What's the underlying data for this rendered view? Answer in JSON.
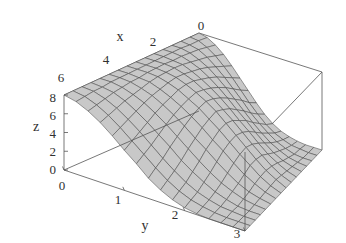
{
  "figure": {
    "type": "surface-plot-3d",
    "background_color": "#ffffff",
    "frame_color": "#555555",
    "surface_fill": "#c8c8c8",
    "mesh_color": "#4a4a4a"
  },
  "chart_data": {
    "type": "line",
    "plot_kind": "surface3d",
    "title": "",
    "xlabel": "x",
    "ylabel": "y",
    "zlabel": "z",
    "xlim": [
      0,
      6
    ],
    "ylim": [
      0,
      3
    ],
    "zlim": [
      0,
      8
    ],
    "x_ticks": [
      "0",
      "2",
      "4",
      "6"
    ],
    "x_tick_values": [
      0,
      2,
      4,
      6
    ],
    "y_ticks": [
      "0",
      "1",
      "2",
      "3"
    ],
    "y_tick_values": [
      0,
      1,
      2,
      3
    ],
    "z_ticks": [
      "0",
      "2",
      "4",
      "6",
      "8"
    ],
    "z_tick_values": [
      0,
      2,
      4,
      6,
      8
    ],
    "grid": false,
    "legend": "none",
    "mesh_rows": 15,
    "mesh_cols": 15,
    "surface_description": "Arched ridge surface, maximum ridge along x running near y=0 side and falling to zero at y=3 front corner",
    "surface_z_grid": [
      [
        8.0,
        8.0,
        8.0,
        8.0,
        8.0,
        8.0,
        8.0,
        8.0,
        8.0,
        8.0,
        8.0,
        8.0,
        8.0,
        8.0,
        8.0,
        8.0
      ],
      [
        7.8,
        7.9,
        7.9,
        8.0,
        8.0,
        8.0,
        8.0,
        8.0,
        8.0,
        8.0,
        8.0,
        8.0,
        7.9,
        7.9,
        7.8,
        7.7
      ],
      [
        7.3,
        7.5,
        7.7,
        7.8,
        7.9,
        7.9,
        8.0,
        8.0,
        8.0,
        7.9,
        7.9,
        7.8,
        7.7,
        7.5,
        7.3,
        7.1
      ],
      [
        6.6,
        6.9,
        7.2,
        7.4,
        7.6,
        7.8,
        7.9,
        7.9,
        7.9,
        7.8,
        7.6,
        7.4,
        7.2,
        6.9,
        6.6,
        6.3
      ],
      [
        5.7,
        6.1,
        6.5,
        6.9,
        7.2,
        7.4,
        7.6,
        7.7,
        7.6,
        7.4,
        7.2,
        6.9,
        6.5,
        6.1,
        5.7,
        5.3
      ],
      [
        4.7,
        5.2,
        5.7,
        6.2,
        6.6,
        6.9,
        7.2,
        7.3,
        7.2,
        6.9,
        6.6,
        6.2,
        5.7,
        5.2,
        4.7,
        4.2
      ],
      [
        3.7,
        4.2,
        4.8,
        5.4,
        5.9,
        6.3,
        6.6,
        6.8,
        6.6,
        6.3,
        5.9,
        5.4,
        4.8,
        4.2,
        3.7,
        3.2
      ],
      [
        2.7,
        3.2,
        3.9,
        4.5,
        5.1,
        5.6,
        6.0,
        6.2,
        6.0,
        5.6,
        5.1,
        4.5,
        3.9,
        3.2,
        2.7,
        2.1
      ],
      [
        1.8,
        2.3,
        2.9,
        3.6,
        4.2,
        4.8,
        5.2,
        5.5,
        5.2,
        4.8,
        4.2,
        3.6,
        2.9,
        2.3,
        1.8,
        1.3
      ],
      [
        1.1,
        1.5,
        2.1,
        2.7,
        3.4,
        3.9,
        4.4,
        4.6,
        4.4,
        3.9,
        3.4,
        2.7,
        2.1,
        1.5,
        1.1,
        0.7
      ],
      [
        0.6,
        0.9,
        1.4,
        1.9,
        2.5,
        3.1,
        3.5,
        3.7,
        3.5,
        3.1,
        2.5,
        1.9,
        1.4,
        0.9,
        0.6,
        0.3
      ],
      [
        0.3,
        0.5,
        0.8,
        1.2,
        1.7,
        2.2,
        2.6,
        2.8,
        2.6,
        2.2,
        1.7,
        1.2,
        0.8,
        0.5,
        0.3,
        0.1
      ],
      [
        0.1,
        0.2,
        0.4,
        0.7,
        1.0,
        1.4,
        1.8,
        1.9,
        1.8,
        1.4,
        1.0,
        0.7,
        0.4,
        0.2,
        0.1,
        0.0
      ],
      [
        0.0,
        0.1,
        0.1,
        0.3,
        0.5,
        0.8,
        1.0,
        1.1,
        1.0,
        0.8,
        0.5,
        0.3,
        0.1,
        0.1,
        0.0,
        0.0
      ],
      [
        0.0,
        0.0,
        0.0,
        0.1,
        0.2,
        0.3,
        0.4,
        0.5,
        0.4,
        0.3,
        0.2,
        0.1,
        0.0,
        0.0,
        0.0,
        0.0
      ],
      [
        0.0,
        0.0,
        0.0,
        0.0,
        0.0,
        0.0,
        0.0,
        0.0,
        0.0,
        0.0,
        0.0,
        0.0,
        0.0,
        0.0,
        0.0,
        0.0
      ]
    ]
  },
  "labels": {
    "x_axis": "x",
    "y_axis": "y",
    "z_axis": "z",
    "x_tick_0": "0",
    "x_tick_2": "2",
    "x_tick_4": "4",
    "x_tick_6": "6",
    "y_tick_0": "0",
    "y_tick_1": "1",
    "y_tick_2": "2",
    "y_tick_3": "3",
    "z_tick_0": "0",
    "z_tick_2": "2",
    "z_tick_4": "4",
    "z_tick_6": "6",
    "z_tick_8": "8"
  }
}
